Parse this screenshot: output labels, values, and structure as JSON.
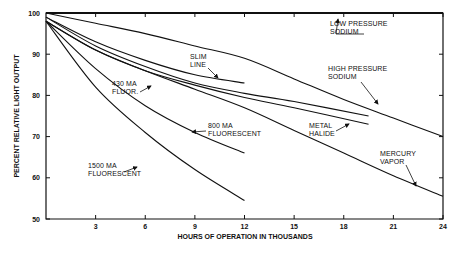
{
  "chart_data": {
    "type": "line",
    "title": "",
    "xlabel": "HOURS OF OPERATION IN THOUSANDS",
    "ylabel": "PERCENT RELATIVE LIGHT OUTPUT",
    "xlim": [
      0,
      24
    ],
    "ylim": [
      50,
      100
    ],
    "xticks": [
      3,
      6,
      9,
      12,
      15,
      18,
      21,
      24
    ],
    "yticks": [
      50,
      60,
      70,
      80,
      90,
      100
    ],
    "grid": false,
    "legend": "inline annotations with arrows",
    "series": [
      {
        "name": "LOW PRESSURE SODIUM",
        "x": [
          0,
          6,
          12,
          15
        ],
        "values": [
          100,
          100,
          100,
          100
        ]
      },
      {
        "name": "HIGH PRESSURE SODIUM",
        "x": [
          0,
          3,
          6,
          9,
          12,
          15,
          18,
          21,
          24
        ],
        "values": [
          100,
          97.5,
          95,
          92,
          89,
          84,
          79,
          74.5,
          70
        ]
      },
      {
        "name": "SLIM LINE",
        "x": [
          0,
          3,
          6,
          9,
          12
        ],
        "values": [
          99,
          93,
          88.5,
          85,
          83
        ]
      },
      {
        "name": "430 MA FLUOR",
        "x": [
          0,
          3,
          6,
          9,
          12,
          15,
          19.5
        ],
        "values": [
          99,
          92,
          87,
          83,
          80.5,
          78.5,
          75
        ]
      },
      {
        "name": "METAL HALIDE",
        "x": [
          0,
          3,
          6,
          9,
          12,
          15,
          19.5
        ],
        "values": [
          98,
          91,
          86,
          82.5,
          79.5,
          77,
          73
        ]
      },
      {
        "name": "MERCURY VAPOR",
        "x": [
          0,
          3,
          6,
          9,
          12,
          15,
          18,
          21,
          24
        ],
        "values": [
          98,
          91,
          86,
          81.5,
          77,
          71.5,
          66,
          60.5,
          55.5
        ]
      },
      {
        "name": "800 MA FLUORESCENT",
        "x": [
          0,
          3,
          6,
          9,
          12
        ],
        "values": [
          98,
          86.5,
          77.5,
          71,
          66
        ]
      },
      {
        "name": "1500 MA FLUORESCENT",
        "x": [
          0,
          3,
          6,
          9,
          12
        ],
        "values": [
          98,
          82,
          71,
          62,
          54.5
        ]
      }
    ],
    "annotations": [
      {
        "text": [
          "LOW PRESSURE",
          "SODIUM"
        ],
        "x": 330,
        "y": 26,
        "arrow": [
          [
            364,
            34
          ],
          [
            336,
            34
          ],
          [
            336,
            34
          ],
          [
            338,
            19
          ]
        ]
      },
      {
        "text": [
          "HIGH PRESSURE",
          "SODIUM"
        ],
        "x": 328,
        "y": 71,
        "arrow": [
          [
            361,
            82
          ],
          [
            378,
            104
          ]
        ]
      },
      {
        "text": [
          "SLIM",
          "LINE"
        ],
        "x": 190,
        "y": 59,
        "arrow": [
          [
            208,
            68
          ],
          [
            218,
            78
          ]
        ]
      },
      {
        "text": [
          "430 MA",
          "FLUOR."
        ],
        "x": 112,
        "y": 86,
        "arrow": [
          [
            140,
            92
          ],
          [
            151,
            86
          ]
        ]
      },
      {
        "text": [
          "800 MA",
          "FLUORESCENT"
        ],
        "x": 208,
        "y": 128,
        "arrow": [
          [
            206,
            131
          ],
          [
            192,
            132
          ]
        ]
      },
      {
        "text": [
          "METAL",
          "HALIDE"
        ],
        "x": 309,
        "y": 128,
        "arrow": [
          [
            336,
            131
          ],
          [
            349,
            124
          ]
        ]
      },
      {
        "text": [
          "MERCURY",
          "VAPOR"
        ],
        "x": 380,
        "y": 156,
        "arrow": [
          [
            406,
            165
          ],
          [
            416,
            186
          ]
        ]
      },
      {
        "text": [
          "1500 MA",
          "FLUORESCENT"
        ],
        "x": 88,
        "y": 168,
        "arrow": [
          [
            124,
            172
          ],
          [
            137,
            167
          ]
        ]
      }
    ]
  }
}
